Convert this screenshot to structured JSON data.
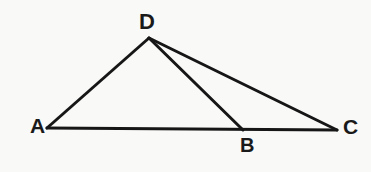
{
  "figure": {
    "background_color": "#f9f9f7",
    "stroke_color": "#161616",
    "stroke_width": 3,
    "label_color": "#1a1a1a",
    "width": 371,
    "height": 172
  },
  "points": {
    "A": {
      "label": "A",
      "x": 47,
      "y": 128
    },
    "B": {
      "label": "B",
      "x": 243,
      "y": 130
    },
    "C": {
      "label": "C",
      "x": 337,
      "y": 130
    },
    "D": {
      "label": "D",
      "x": 149,
      "y": 38
    }
  },
  "segments": [
    {
      "name": "AD",
      "from": "A",
      "to": "D",
      "path": "M 47 128 L 149 38"
    },
    {
      "name": "AC",
      "from": "A",
      "to": "C",
      "path": "M 47 128 L 337 130"
    },
    {
      "name": "DB",
      "from": "D",
      "to": "B",
      "path": "M 149 38 L 243 130"
    },
    {
      "name": "DC",
      "from": "D",
      "to": "C",
      "path": "M 149 38 L 337 130"
    }
  ]
}
